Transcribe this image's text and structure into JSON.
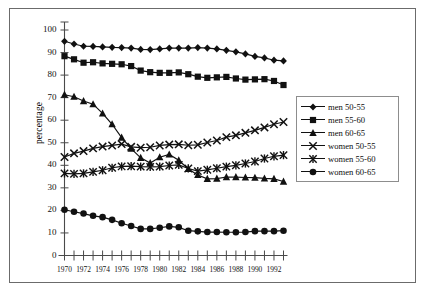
{
  "chart_data": {
    "type": "line",
    "title": "",
    "xlabel": "",
    "ylabel": "percentage",
    "xlim": [
      1970,
      1993
    ],
    "ylim": [
      0,
      100
    ],
    "grid": false,
    "legend_position": "right",
    "x": [
      1970,
      1971,
      1972,
      1973,
      1974,
      1975,
      1976,
      1977,
      1978,
      1979,
      1980,
      1981,
      1982,
      1983,
      1984,
      1985,
      1986,
      1987,
      1988,
      1989,
      1990,
      1991,
      1992,
      1993
    ],
    "x_tick_labels": [
      "1970",
      "1972",
      "1974",
      "1976",
      "1978",
      "1980",
      "1982",
      "1984",
      "1986",
      "1988",
      "1990",
      "1992"
    ],
    "y_tick_labels": [
      "0",
      "10",
      "20",
      "30",
      "40",
      "50",
      "60",
      "70",
      "80",
      "90",
      "100"
    ],
    "y_ticks": [
      0,
      10,
      20,
      30,
      40,
      50,
      60,
      70,
      80,
      90,
      100
    ],
    "series": [
      {
        "name": "men 50-55",
        "marker": "diamond",
        "color": "#111111",
        "values": [
          95.0,
          93.8,
          92.8,
          92.7,
          92.5,
          92.3,
          92.2,
          92.0,
          91.4,
          91.3,
          91.6,
          92.0,
          92.0,
          92.0,
          92.2,
          92.0,
          91.6,
          91.0,
          90.3,
          89.4,
          88.3,
          87.6,
          86.6,
          86.3
        ]
      },
      {
        "name": "men 55-60",
        "marker": "square",
        "color": "#111111",
        "values": [
          88.4,
          87.0,
          85.5,
          85.7,
          85.2,
          85.0,
          84.8,
          84.0,
          82.0,
          81.3,
          81.0,
          81.0,
          81.2,
          80.4,
          79.3,
          78.8,
          79.0,
          79.2,
          78.5,
          78.0,
          78.1,
          78.2,
          77.4,
          75.6
        ]
      },
      {
        "name": "men 60-65",
        "marker": "triangle",
        "color": "#111111",
        "values": [
          71.3,
          70.4,
          68.5,
          67.1,
          63.0,
          58.2,
          52.3,
          47.4,
          43.3,
          41.0,
          43.6,
          44.8,
          42.2,
          38.4,
          35.7,
          34.0,
          34.1,
          34.8,
          34.8,
          34.6,
          34.5,
          34.2,
          34.0,
          32.8
        ]
      },
      {
        "name": "women 50-55",
        "marker": "cross",
        "color": "#111111",
        "values": [
          43.7,
          45.3,
          46.3,
          47.5,
          48.3,
          48.8,
          49.4,
          48.2,
          47.8,
          48.0,
          48.8,
          49.2,
          49.3,
          48.9,
          49.1,
          50.1,
          51.0,
          52.5,
          53.3,
          54.4,
          55.5,
          56.8,
          58.2,
          59.2
        ]
      },
      {
        "name": "women 55-60",
        "marker": "star",
        "color": "#111111",
        "values": [
          36.4,
          36.2,
          36.4,
          37.1,
          37.8,
          38.9,
          39.5,
          39.6,
          39.4,
          39.3,
          39.4,
          39.9,
          40.2,
          38.6,
          37.4,
          38.0,
          38.7,
          39.4,
          40.0,
          40.8,
          41.7,
          43.0,
          44.0,
          44.5
        ]
      },
      {
        "name": "women 60-65",
        "marker": "circle",
        "color": "#111111",
        "values": [
          20.3,
          19.4,
          18.6,
          17.6,
          17.0,
          15.8,
          14.3,
          13.1,
          11.8,
          11.8,
          12.3,
          12.9,
          12.5,
          11.0,
          10.7,
          10.4,
          10.4,
          10.3,
          10.3,
          10.4,
          10.8,
          10.8,
          10.8,
          11.0
        ]
      }
    ]
  },
  "legend": {
    "items": [
      {
        "label": "men 50-55"
      },
      {
        "label": "men 55-60"
      },
      {
        "label": "men 60-65"
      },
      {
        "label": "women 50-55"
      },
      {
        "label": "women 55-60"
      },
      {
        "label": "women 60-65"
      }
    ]
  }
}
